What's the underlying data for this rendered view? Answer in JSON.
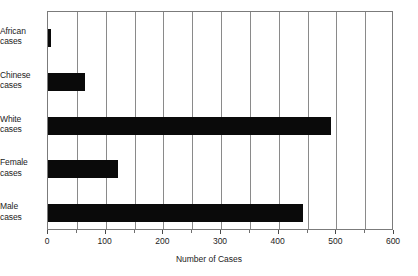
{
  "chart_data": {
    "type": "bar",
    "orientation": "horizontal",
    "title": "",
    "xlabel": "Number of Cases",
    "ylabel": "",
    "categories": [
      "African cases",
      "Chinese cases",
      "White cases",
      "Female cases",
      "Male cases"
    ],
    "category_lines": [
      [
        "African",
        "cases"
      ],
      [
        "Chinese",
        "cases"
      ],
      [
        "White",
        "cases"
      ],
      [
        "Female",
        "cases"
      ],
      [
        "Male",
        "cases"
      ]
    ],
    "values": [
      5,
      65,
      490,
      122,
      443
    ],
    "xlim": [
      0,
      600
    ],
    "xticks": [
      0,
      100,
      200,
      300,
      400,
      500,
      600
    ],
    "xticklabels": [
      "0",
      "100",
      "200",
      "300",
      "400",
      "500",
      "600"
    ],
    "minor_tick_step": 50,
    "grid": "vertical",
    "gridlines_at": [
      50,
      100,
      150,
      200,
      250,
      300,
      350,
      400,
      450,
      500,
      550
    ],
    "legend": null,
    "bar_color": "#0a0a0a",
    "frame_color": "#7b7b7b",
    "background": "#ffffff"
  }
}
